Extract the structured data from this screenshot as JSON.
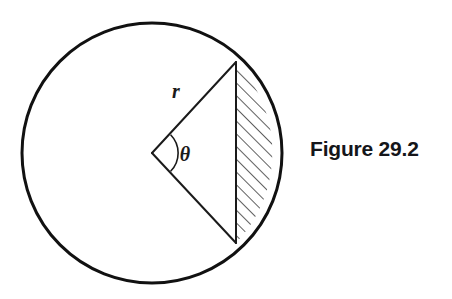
{
  "figure": {
    "caption": "Figure 29.2",
    "caption_color": "#15161a",
    "stroke_color": "#111111",
    "background_color": "#ffffff",
    "labels": {
      "radius": "r",
      "angle": "θ"
    },
    "icons": {
      "circle": "circle-outline-icon",
      "radius_line": "radius-line-icon",
      "chord": "chord-line-icon",
      "angle_arc": "angle-arc-icon",
      "hatched_segment": "hatched-segment-icon"
    }
  },
  "geometry": {
    "type": "circle-with-hatched-segment",
    "circle": {
      "center_x": 152,
      "center_y": 153,
      "radius": 130,
      "stroke_width": 3
    },
    "chord": {
      "x": 236,
      "y_top": 62,
      "y_bottom": 243,
      "stroke_width": 2
    },
    "radii": [
      {
        "name": "upper-radius",
        "x1": 152,
        "y1": 153,
        "x2": 236,
        "y2": 62
      },
      {
        "name": "lower-radius",
        "x1": 152,
        "y1": 153,
        "x2": 236,
        "y2": 243
      }
    ],
    "angle_arc": {
      "vertex_x": 152,
      "vertex_y": 153,
      "arc_radius": 26,
      "angle_degrees": 94
    },
    "hatching": {
      "angle_degrees": 45,
      "spacing_px": 9,
      "stroke_width": 1.4
    },
    "label_positions": {
      "radius": {
        "x": 176,
        "y": 98
      },
      "angle": {
        "x": 183,
        "y": 160
      }
    }
  }
}
